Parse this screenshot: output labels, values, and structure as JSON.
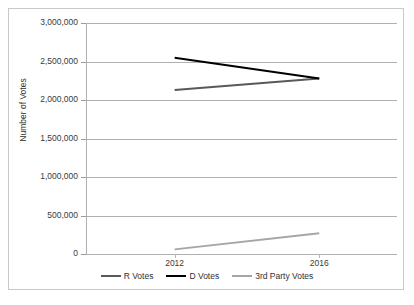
{
  "chart_data": {
    "type": "line",
    "title": "",
    "xlabel": "",
    "ylabel": "Number of Votes",
    "x": [
      "2012",
      "2016"
    ],
    "categories": [
      "2012",
      "2016"
    ],
    "ylim": [
      0,
      3000000
    ],
    "ytick_labels": [
      "3,000,000",
      "2,500,000",
      "2,000,000",
      "1,500,000",
      "1,000,000",
      "500,000",
      "0"
    ],
    "ytick_values": [
      3000000,
      2500000,
      2000000,
      1500000,
      1000000,
      500000,
      0
    ],
    "grid": true,
    "legend_position": "bottom",
    "series": [
      {
        "name": "R Votes",
        "color": "#595959",
        "values": [
          2130000,
          2280000
        ]
      },
      {
        "name": "D Votes",
        "color": "#000000",
        "values": [
          2550000,
          2280000
        ]
      },
      {
        "name": "3rd Party Votes",
        "color": "#a6a6a6",
        "values": [
          60000,
          270000
        ]
      }
    ]
  },
  "axis": {
    "y_title": "Number of Votes",
    "ticks": [
      {
        "label": "3,000,000"
      },
      {
        "label": "2,500,000"
      },
      {
        "label": "2,000,000"
      },
      {
        "label": "1,500,000"
      },
      {
        "label": "1,000,000"
      },
      {
        "label": "500,000"
      },
      {
        "label": "0"
      }
    ],
    "x_ticks": [
      {
        "label": "2012"
      },
      {
        "label": "2016"
      }
    ]
  },
  "legend": {
    "items": [
      {
        "label": "R Votes",
        "color": "#595959"
      },
      {
        "label": "D Votes",
        "color": "#000000"
      },
      {
        "label": "3rd Party Votes",
        "color": "#a6a6a6"
      }
    ]
  },
  "colors": {
    "frame_border": "#c8c8c8",
    "gridline": "#b0b0b0",
    "text": "#2f2f2f"
  }
}
